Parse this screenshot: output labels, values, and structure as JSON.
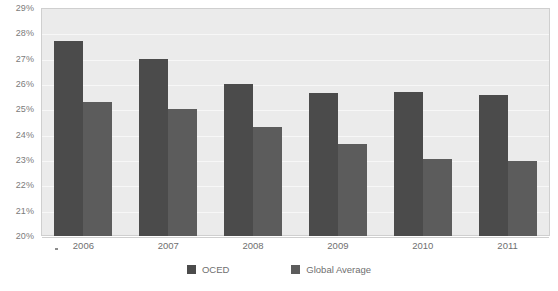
{
  "chart_data": {
    "type": "bar",
    "title": "",
    "subtitle": "",
    "xlabel": "",
    "ylabel": "",
    "categories": [
      "2006",
      "2007",
      "2008",
      "2009",
      "2010",
      "2011"
    ],
    "series": [
      {
        "name": "OCED",
        "color": "#4b4b4b",
        "values": [
          27.7,
          27.0,
          26.0,
          25.65,
          25.7,
          25.55
        ]
      },
      {
        "name": "Global Average",
        "color": "#5c5c5c",
        "values": [
          25.3,
          25.0,
          24.3,
          23.65,
          23.05,
          22.95
        ]
      }
    ],
    "ylim": [
      20,
      29
    ],
    "ytick_values": [
      20,
      21,
      22,
      23,
      24,
      25,
      26,
      27,
      28,
      29
    ],
    "ytick_labels": [
      "20%",
      "21%",
      "22%",
      "23%",
      "24%",
      "25%",
      "26%",
      "27%",
      "28%",
      "29%"
    ],
    "value_suffix": "%",
    "grid": true,
    "grid_axis": "y",
    "legend_position": "bottom",
    "plot_background": "#ebebeb",
    "gridline_color": "#f7f7f7",
    "frame_color": "#cfcfcf",
    "axis_text_color": "#6f6f6f"
  }
}
